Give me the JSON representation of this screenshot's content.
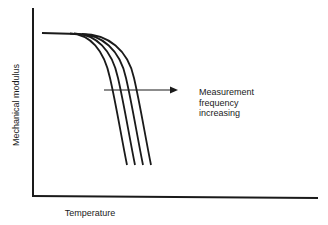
{
  "diagram": {
    "title": "",
    "x_axis_label": "Temperature",
    "y_axis_label": "Mechanical modulus",
    "annotation": {
      "lines": [
        "Measurement",
        "frequency",
        "increasing"
      ],
      "arrow_direction": "right"
    },
    "curves": [
      {
        "name": "curve-1",
        "order": 1
      },
      {
        "name": "curve-2",
        "order": 2
      },
      {
        "name": "curve-3",
        "order": 3
      },
      {
        "name": "curve-4",
        "order": 4
      }
    ],
    "colors": {
      "line": "#1a1a1a",
      "background": "#ffffff"
    }
  }
}
